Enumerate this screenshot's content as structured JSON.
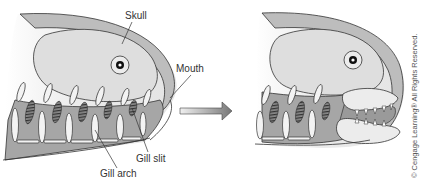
{
  "diagram": {
    "panels": [
      {
        "id": "before",
        "description": "Jawless fish head with gill arches and gill slits"
      },
      {
        "id": "after",
        "description": "Jawed fish head; anterior gill arches modified into jaws with teeth"
      }
    ],
    "labels": {
      "skull": "Skull",
      "mouth": "Mouth",
      "gill_slit": "Gill slit",
      "gill_arch": "Gill arch"
    },
    "arrow": {
      "direction": "right",
      "meaning": "evolutionary transition"
    },
    "copyright": "© Cengage Learning® All Rights Reserved.",
    "colors": {
      "head_outer": "#e9e9e9",
      "skull_band": "#b9b9b9",
      "braincase": "#dcdcdc",
      "gill_region": "#a9a9a9",
      "arch_bones": "#f2f2f2",
      "outline": "#333333"
    }
  }
}
